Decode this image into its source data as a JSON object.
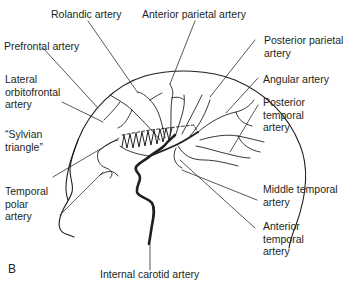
{
  "figure": {
    "panel_label": "B",
    "labels": {
      "rolandic": "Rolandic artery",
      "anterior_parietal": "Anterior parietal artery",
      "prefrontal": "Prefrontal artery",
      "lateral_orbitofrontal": "Lateral\norbitofrontal\nartery",
      "sylvian_triangle": "“Sylvian\ntriangle”",
      "temporal_polar": "Temporal\npolar\nartery",
      "posterior_parietal": "Posterior parietal\nartery",
      "angular": "Angular artery",
      "posterior_temporal": "Posterior\ntemporal\nartery",
      "middle_temporal": "Middle temporal\nartery",
      "anterior_temporal": "Anterior\ntemporal\nartery",
      "internal_carotid": "Internal carotid artery"
    },
    "colors": {
      "line": "#231f20",
      "background": "#ffffff"
    }
  }
}
